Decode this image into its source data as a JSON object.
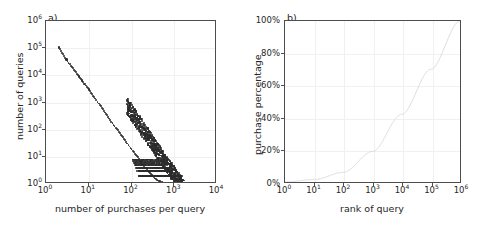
{
  "figure": {
    "background": "#ffffff",
    "axis_color": "#4d4d4d",
    "grid_color": "#f0f0f2",
    "marker_color": "#2b2b2b",
    "curve_color": "#d8d8dc"
  },
  "panels": [
    {
      "id": "a",
      "label": "a)",
      "xlabel": "number of purchases per query",
      "ylabel": "number of queries",
      "xticks": [
        "10",
        "10",
        "10",
        "10",
        "10"
      ],
      "xtick_exponents": [
        "0",
        "1",
        "2",
        "3",
        "4"
      ],
      "yticks": [
        "10",
        "10",
        "10",
        "10",
        "10",
        "10",
        "10"
      ],
      "ytick_exponents": [
        "0",
        "1",
        "2",
        "3",
        "4",
        "5",
        "6"
      ]
    },
    {
      "id": "b",
      "label": "b)",
      "xlabel": "rank of query",
      "ylabel": "purchase percentage",
      "xticks": [
        "10",
        "10",
        "10",
        "10",
        "10",
        "10",
        "10"
      ],
      "xtick_exponents": [
        "0",
        "1",
        "2",
        "3",
        "4",
        "5",
        "6"
      ],
      "yticks": [
        "0%",
        "20%",
        "40%",
        "60%",
        "80%",
        "100%"
      ]
    }
  ],
  "chart_data": [
    {
      "type": "scatter",
      "panel": "a)",
      "title": "",
      "xlabel": "number of purchases per query",
      "ylabel": "number of queries",
      "xscale": "log",
      "yscale": "log",
      "xlim": [
        1,
        10000
      ],
      "ylim": [
        1,
        1000000
      ],
      "grid": true,
      "legend": null,
      "description": "Heavy-tailed power-law distribution of number of queries versus number of purchases per query; slope approximately -2.2 on log-log axes, with a dense saturated band of points at low counts (1-5 queries) extending to roughly 2000 purchases per query.",
      "points": [
        [
          2,
          105000
        ],
        [
          3,
          38000
        ],
        [
          4,
          20000
        ],
        [
          5,
          13000
        ],
        [
          6,
          9000
        ],
        [
          7,
          6500
        ],
        [
          8,
          4800
        ],
        [
          9,
          3700
        ],
        [
          10,
          3000
        ],
        [
          12,
          2000
        ],
        [
          14,
          1400
        ],
        [
          16,
          1050
        ],
        [
          18,
          800
        ],
        [
          20,
          640
        ],
        [
          24,
          430
        ],
        [
          28,
          300
        ],
        [
          32,
          220
        ],
        [
          36,
          170
        ],
        [
          40,
          135
        ],
        [
          45,
          105
        ],
        [
          50,
          84
        ],
        [
          60,
          58
        ],
        [
          70,
          42
        ],
        [
          80,
          31
        ],
        [
          90,
          24
        ],
        [
          100,
          19
        ],
        [
          120,
          13
        ],
        [
          140,
          9.5
        ],
        [
          160,
          7.2
        ],
        [
          180,
          5.6
        ],
        [
          200,
          4.5
        ],
        [
          240,
          3.1
        ],
        [
          280,
          2.4
        ],
        [
          320,
          1.9
        ],
        [
          360,
          1.6
        ],
        [
          400,
          1.4
        ],
        [
          500,
          1.2
        ],
        [
          600,
          1.1
        ],
        [
          800,
          1
        ],
        [
          1000,
          1
        ],
        [
          1400,
          1
        ],
        [
          2000,
          1
        ]
      ]
    },
    {
      "type": "line",
      "panel": "b)",
      "title": "",
      "xlabel": "rank of query",
      "ylabel": "purchase percentage",
      "xscale": "log",
      "yscale": "linear",
      "xlim": [
        1,
        1000000
      ],
      "ylim": [
        0,
        100
      ],
      "grid": true,
      "legend": null,
      "description": "Cumulative purchase percentage as a function of query rank; monotonically increasing convex curve rising slowly from 0% at rank 1 to about 20% near rank 1000 and reaching 100% at rank 1,000,000.",
      "x": [
        1,
        10,
        100,
        1000,
        10000,
        100000,
        1000000
      ],
      "y": [
        0,
        1.5,
        6,
        19,
        42,
        70,
        100
      ]
    }
  ]
}
